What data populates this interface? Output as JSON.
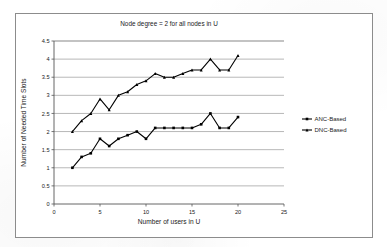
{
  "figure": {
    "frame_border_color": "#8c8c8c",
    "background": "#ffffff"
  },
  "chart_data": {
    "type": "line",
    "title": "Node degree = 2 for all nodes in U",
    "xlabel": "Number of users in U",
    "ylabel": "Number of Needed Time Slots",
    "xlim": [
      0,
      25
    ],
    "ylim": [
      0,
      4.5
    ],
    "xticks": [
      0,
      5,
      10,
      15,
      20,
      25
    ],
    "xtick_labels": [
      "0",
      "5",
      "10",
      "15",
      "20",
      "25"
    ],
    "yticks": [
      0,
      0.5,
      1,
      1.5,
      2,
      2.5,
      3,
      3.5,
      4,
      4.5
    ],
    "ytick_labels": [
      "0",
      "0.5",
      "1",
      "1.5",
      "2",
      "2.5",
      "3",
      "3.5",
      "4",
      "4.5"
    ],
    "grid": "horizontal",
    "grid_color": "#9a9a9a",
    "legend_position": "right",
    "x": [
      2,
      3,
      4,
      5,
      6,
      7,
      8,
      9,
      10,
      11,
      12,
      13,
      14,
      15,
      16,
      17,
      18,
      19,
      20
    ],
    "series": [
      {
        "name": "ANC-Based",
        "marker": "square",
        "color": "#000000",
        "values": [
          1.0,
          1.3,
          1.4,
          1.8,
          1.6,
          1.8,
          1.9,
          2.0,
          1.8,
          2.1,
          2.1,
          2.1,
          2.1,
          2.1,
          2.2,
          2.5,
          2.1,
          2.1,
          2.4
        ]
      },
      {
        "name": "DNC-Based",
        "marker": "triangle",
        "color": "#000000",
        "values": [
          2.0,
          2.3,
          2.5,
          2.9,
          2.6,
          3.0,
          3.1,
          3.3,
          3.4,
          3.6,
          3.5,
          3.5,
          3.6,
          3.7,
          3.7,
          4.0,
          3.7,
          3.7,
          4.1
        ]
      }
    ]
  },
  "legend": {
    "entries": [
      {
        "label": "ANC-Based"
      },
      {
        "label": "DNC-Based"
      }
    ]
  }
}
